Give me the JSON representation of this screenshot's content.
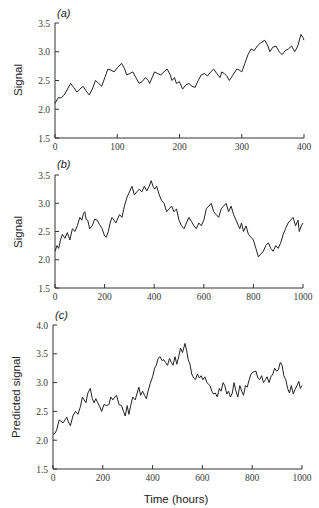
{
  "figure": {
    "xlabel": "Time (hours)"
  },
  "chart_data": [
    {
      "type": "line",
      "panel_label": "(a)",
      "title": "",
      "xlabel": "",
      "ylabel": "Signal",
      "xlim": [
        0,
        400
      ],
      "ylim": [
        1.5,
        3.5
      ],
      "xticks": [
        0,
        100,
        200,
        300,
        400
      ],
      "yticks": [
        "1.5",
        "2.0",
        "2.5",
        "3.0",
        "3.5"
      ],
      "grid": false,
      "legend": null,
      "series": [
        {
          "name": "Signal",
          "x": [
            0,
            5,
            10,
            15,
            20,
            25,
            30,
            35,
            40,
            45,
            50,
            55,
            60,
            65,
            70,
            75,
            80,
            85,
            90,
            95,
            100,
            107,
            112,
            115,
            120,
            125,
            130,
            135,
            140,
            145,
            150,
            152,
            156,
            160,
            165,
            170,
            175,
            180,
            185,
            188,
            192,
            195,
            200,
            205,
            210,
            215,
            220,
            225,
            230,
            235,
            240,
            245,
            250,
            255,
            260,
            265,
            268,
            272,
            276,
            280,
            285,
            292,
            296,
            300,
            305,
            310,
            315,
            320,
            325,
            330,
            337,
            342,
            345,
            350,
            355,
            360,
            365,
            370,
            375,
            380,
            385,
            390,
            395,
            398,
            400
          ],
          "values": [
            2.1,
            2.2,
            2.2,
            2.25,
            2.35,
            2.45,
            2.38,
            2.3,
            2.35,
            2.4,
            2.32,
            2.25,
            2.35,
            2.5,
            2.45,
            2.4,
            2.55,
            2.7,
            2.68,
            2.65,
            2.72,
            2.8,
            2.7,
            2.6,
            2.62,
            2.65,
            2.55,
            2.45,
            2.48,
            2.55,
            2.5,
            2.45,
            2.55,
            2.65,
            2.62,
            2.6,
            2.65,
            2.7,
            2.6,
            2.5,
            2.55,
            2.45,
            2.48,
            2.35,
            2.42,
            2.45,
            2.4,
            2.38,
            2.5,
            2.6,
            2.62,
            2.58,
            2.65,
            2.7,
            2.62,
            2.55,
            2.65,
            2.62,
            2.58,
            2.5,
            2.58,
            2.7,
            2.68,
            2.65,
            2.8,
            2.95,
            3.05,
            3.02,
            3.1,
            3.15,
            3.2,
            3.1,
            3.0,
            3.08,
            3.1,
            3.0,
            2.95,
            3.02,
            3.05,
            3.1,
            3.0,
            3.1,
            3.3,
            3.25,
            3.2
          ]
        }
      ]
    },
    {
      "type": "line",
      "panel_label": "(b)",
      "title": "",
      "xlabel": "",
      "ylabel": "Signal",
      "xlim": [
        0,
        1000
      ],
      "ylim": [
        1.5,
        3.5
      ],
      "xticks": [
        0,
        200,
        400,
        600,
        800,
        1000
      ],
      "yticks": [
        "1.5",
        "2.0",
        "2.5",
        "3.0",
        "3.5"
      ],
      "grid": false,
      "legend": null,
      "series": [
        {
          "name": "Signal",
          "x": [
            0,
            8,
            15,
            22,
            30,
            40,
            50,
            60,
            70,
            80,
            90,
            100,
            108,
            115,
            120,
            125,
            132,
            140,
            150,
            160,
            170,
            180,
            190,
            200,
            207,
            215,
            222,
            230,
            238,
            245,
            252,
            260,
            270,
            280,
            290,
            300,
            310,
            320,
            330,
            340,
            350,
            360,
            370,
            380,
            388,
            395,
            402,
            410,
            420,
            430,
            440,
            450,
            460,
            470,
            480,
            490,
            500,
            510,
            520,
            530,
            540,
            550,
            560,
            570,
            580,
            590,
            600,
            610,
            620,
            630,
            640,
            650,
            660,
            670,
            680,
            690,
            700,
            710,
            720,
            730,
            740,
            745,
            752,
            760,
            770,
            780,
            790,
            800,
            810,
            820,
            830,
            840,
            850,
            860,
            870,
            880,
            890,
            900,
            910,
            920,
            930,
            940,
            950,
            960,
            970,
            980,
            985,
            993,
            1000
          ],
          "values": [
            2.15,
            2.25,
            2.2,
            2.35,
            2.45,
            2.38,
            2.48,
            2.35,
            2.55,
            2.5,
            2.6,
            2.75,
            2.7,
            2.82,
            2.85,
            2.72,
            2.7,
            2.55,
            2.6,
            2.72,
            2.7,
            2.62,
            2.55,
            2.42,
            2.4,
            2.5,
            2.65,
            2.75,
            2.7,
            2.65,
            2.72,
            2.8,
            2.75,
            2.95,
            3.1,
            3.2,
            3.3,
            3.15,
            3.2,
            3.25,
            3.2,
            3.3,
            3.22,
            3.3,
            3.4,
            3.3,
            3.25,
            3.3,
            3.15,
            3.05,
            3.0,
            2.85,
            2.9,
            2.95,
            2.85,
            2.9,
            2.7,
            2.6,
            2.55,
            2.65,
            2.75,
            2.68,
            2.6,
            2.55,
            2.65,
            2.6,
            2.7,
            2.9,
            2.95,
            3.0,
            2.85,
            2.8,
            2.75,
            2.9,
            2.95,
            3.0,
            2.85,
            2.95,
            2.8,
            2.7,
            2.6,
            2.55,
            2.65,
            2.5,
            2.6,
            2.45,
            2.4,
            2.35,
            2.2,
            2.05,
            2.1,
            2.15,
            2.25,
            2.3,
            2.2,
            2.15,
            2.25,
            2.2,
            2.3,
            2.45,
            2.55,
            2.65,
            2.7,
            2.75,
            2.6,
            2.7,
            2.5,
            2.6,
            2.65
          ]
        }
      ]
    },
    {
      "type": "line",
      "panel_label": "(c)",
      "title": "",
      "xlabel": "Time (hours)",
      "ylabel": "Predicted signal",
      "xlim": [
        0,
        1000
      ],
      "ylim": [
        1.5,
        4.0
      ],
      "xticks": [
        0,
        200,
        400,
        600,
        800,
        1000
      ],
      "yticks": [
        "1.5",
        "2.0",
        "2.5",
        "3.0",
        "3.5",
        "4.0"
      ],
      "grid": false,
      "legend": null,
      "series": [
        {
          "name": "Predicted signal",
          "x": [
            0,
            8,
            15,
            25,
            40,
            48,
            55,
            62,
            70,
            80,
            90,
            100,
            110,
            118,
            125,
            132,
            140,
            150,
            158,
            165,
            172,
            180,
            188,
            195,
            205,
            215,
            225,
            232,
            240,
            248,
            255,
            265,
            275,
            283,
            290,
            298,
            305,
            312,
            320,
            330,
            338,
            345,
            352,
            360,
            368,
            375,
            382,
            390,
            400,
            408,
            415,
            422,
            430,
            438,
            445,
            452,
            460,
            468,
            475,
            482,
            490,
            497,
            505,
            512,
            520,
            530,
            537,
            543,
            550,
            557,
            565,
            572,
            580,
            588,
            595,
            602,
            610,
            618,
            630,
            638,
            645,
            652,
            660,
            668,
            675,
            683,
            690,
            698,
            705,
            713,
            720,
            727,
            735,
            742,
            750,
            758,
            765,
            773,
            780,
            788,
            795,
            803,
            815,
            823,
            830,
            838,
            845,
            853,
            860,
            868,
            875,
            883,
            890,
            898,
            905,
            913,
            920,
            927,
            935,
            942,
            950,
            957,
            965,
            972,
            980,
            987,
            993,
            1000
          ],
          "values": [
            2.1,
            2.12,
            2.18,
            2.35,
            2.3,
            2.35,
            2.4,
            2.32,
            2.25,
            2.42,
            2.5,
            2.45,
            2.58,
            2.75,
            2.7,
            2.65,
            2.82,
            2.9,
            2.72,
            2.65,
            2.72,
            2.65,
            2.58,
            2.5,
            2.62,
            2.6,
            2.62,
            2.75,
            2.7,
            2.75,
            2.78,
            2.62,
            2.6,
            2.5,
            2.42,
            2.6,
            2.45,
            2.6,
            2.75,
            2.7,
            2.82,
            2.92,
            2.78,
            2.85,
            2.78,
            2.72,
            2.85,
            2.98,
            3.1,
            3.25,
            3.3,
            3.42,
            3.45,
            3.38,
            3.4,
            3.35,
            3.3,
            3.42,
            3.35,
            3.3,
            3.45,
            3.32,
            3.45,
            3.6,
            3.52,
            3.68,
            3.55,
            3.4,
            3.32,
            3.15,
            3.08,
            3.05,
            3.15,
            3.08,
            3.12,
            3.05,
            3.1,
            3.0,
            2.95,
            2.85,
            2.8,
            2.82,
            2.75,
            2.9,
            2.85,
            3.0,
            2.95,
            2.8,
            2.85,
            2.75,
            2.82,
            3.0,
            2.85,
            2.75,
            2.95,
            2.85,
            2.78,
            2.95,
            2.92,
            3.05,
            3.15,
            3.18,
            3.2,
            3.08,
            3.05,
            3.12,
            3.0,
            3.05,
            3.1,
            3.0,
            3.1,
            3.15,
            3.25,
            3.2,
            3.22,
            3.35,
            3.3,
            3.12,
            3.05,
            2.9,
            2.82,
            2.95,
            2.8,
            2.88,
            2.95,
            3.02,
            2.9,
            2.95
          ]
        }
      ]
    }
  ]
}
